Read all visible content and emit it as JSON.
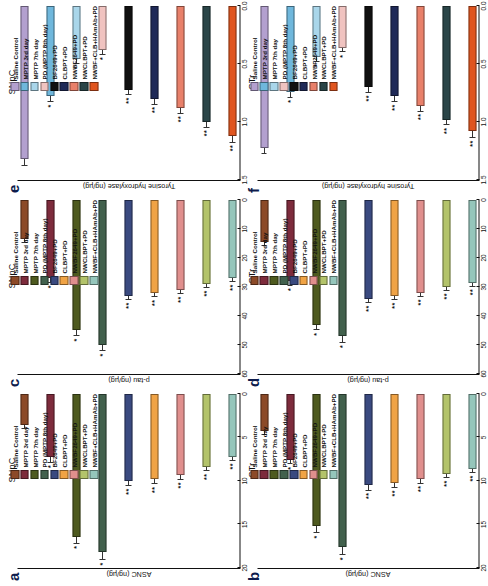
{
  "figure": {
    "groups": [
      {
        "label": "Saline Control",
        "color": "#8c4a28"
      },
      {
        "label": "MPTP 3rd day",
        "color": "#7d2b3c"
      },
      {
        "label": "MPTP 7th day",
        "color": "#4e5a1f"
      },
      {
        "label": "PD (MPTP 8th day)",
        "color": "#42614d"
      },
      {
        "label": "BF2649+PD",
        "color": "#3a4a80"
      },
      {
        "label": "CLBPT+PD",
        "color": "#f0a345"
      },
      {
        "label": "NWBF2649+PD",
        "color": "#e08f8d"
      },
      {
        "label": "NWCLBPT+PD",
        "color": "#b3c36a"
      },
      {
        "label": "NWBF+CLB+HAmAb+PD",
        "color": "#95c6bb"
      }
    ],
    "groups_ef": [
      {
        "label": "Saline Control",
        "color": "#b3a0cf"
      },
      {
        "label": "MPTP 3rd day",
        "color": "#6fb7dc"
      },
      {
        "label": "MPTP 7th day",
        "color": "#a9d6ea"
      },
      {
        "label": "PD (MPTP 8th day)",
        "color": "#f0c3c0"
      },
      {
        "label": "BF2649+PD",
        "color": "#111111"
      },
      {
        "label": "CLBPT+PD",
        "color": "#1f2a58"
      },
      {
        "label": "NWBF2649+PD",
        "color": "#e8806a"
      },
      {
        "label": "NWCLBPT+PD",
        "color": "#2a4548"
      },
      {
        "label": "NWBF+CLB+HAmAb+PD",
        "color": "#e0551f"
      }
    ]
  },
  "chart_data": [
    {
      "panel": "a",
      "type": "bar",
      "title": "SNpC",
      "xlabel": "",
      "ylabel": "ASNC (ng/µg)",
      "ylim": [
        0,
        20
      ],
      "ticks": [
        0,
        5,
        10,
        15,
        20
      ],
      "orientation": "horizontal",
      "categories": [
        "Saline Control",
        "MPTP 3rd day",
        "MPTP 7th day",
        "PD (MPTP 8th day)",
        "BF2649+PD",
        "CLBPT+PD",
        "NWBF2649+PD",
        "NWCLBPT+PD",
        "NWBF+CLB+HAmAb+PD"
      ],
      "values": [
        3.6,
        7.3,
        16.4,
        18.2,
        10.0,
        9.8,
        9.3,
        8.4,
        7.2
      ],
      "errors": [
        0.4,
        0.6,
        0.8,
        0.9,
        0.6,
        0.6,
        0.6,
        0.5,
        0.5
      ],
      "annotations": [
        "",
        "*",
        "*",
        "*",
        "**",
        "**",
        "**",
        "**",
        "**"
      ]
    },
    {
      "panel": "b",
      "type": "bar",
      "title": "STr",
      "xlabel": "",
      "ylabel": "ASNC (ng/µg)",
      "ylim": [
        0,
        20
      ],
      "ticks": [
        0,
        5,
        10,
        15,
        20
      ],
      "orientation": "horizontal",
      "categories": [
        "Saline Control",
        "MPTP 3rd day",
        "MPTP 7th day",
        "PD (MPTP 8th day)",
        "BF2649+PD",
        "CLBPT+PD",
        "NWBF2649+PD",
        "NWCLBPT+PD",
        "NWBF+CLB+HAmAb+PD"
      ],
      "values": [
        4.3,
        7.6,
        15.2,
        17.6,
        10.5,
        10.2,
        9.8,
        9.2,
        8.6
      ],
      "errors": [
        0.4,
        0.5,
        0.8,
        0.9,
        0.6,
        0.6,
        0.5,
        0.5,
        0.5
      ],
      "annotations": [
        "",
        "*",
        "*",
        "*",
        "**",
        "**",
        "**",
        "**",
        "**"
      ]
    },
    {
      "panel": "c",
      "type": "bar",
      "title": "SNpC",
      "xlabel": "",
      "ylabel": "p-tau (ng/µg)",
      "ylim": [
        0,
        60
      ],
      "ticks": [
        0,
        10,
        20,
        30,
        40,
        50,
        60
      ],
      "orientation": "horizontal",
      "categories": [
        "Saline Control",
        "MPTP 3rd day",
        "MPTP 7th day",
        "PD (MPTP 8th day)",
        "BF2649+PD",
        "CLBPT+PD",
        "NWBF2649+PD",
        "NWCLBPT+PD",
        "NWBF+CLB+HAmAb+PD"
      ],
      "values": [
        13.5,
        27.0,
        45.0,
        50.0,
        33.0,
        32.0,
        31.0,
        29.0,
        27.0
      ],
      "errors": [
        1.2,
        1.6,
        2.0,
        2.2,
        1.6,
        1.6,
        1.5,
        1.4,
        1.4
      ],
      "annotations": [
        "",
        "*",
        "*",
        "*",
        "**",
        "**",
        "**",
        "**",
        "**"
      ]
    },
    {
      "panel": "d",
      "type": "bar",
      "title": "STr",
      "xlabel": "",
      "ylabel": "p-tau (ng/µg)",
      "ylim": [
        0,
        60
      ],
      "ticks": [
        0,
        10,
        20,
        30,
        40,
        50,
        60
      ],
      "orientation": "horizontal",
      "categories": [
        "Saline Control",
        "MPTP 3rd day",
        "MPTP 7th day",
        "PD (MPTP 8th day)",
        "BF2649+PD",
        "CLBPT+PD",
        "NWBF2649+PD",
        "NWCLBPT+PD",
        "NWBF+CLB+HAmAb+PD"
      ],
      "values": [
        14.5,
        28.0,
        43.0,
        47.0,
        34.0,
        33.0,
        32.0,
        30.0,
        28.5
      ],
      "errors": [
        1.2,
        1.6,
        2.0,
        2.2,
        1.6,
        1.6,
        1.5,
        1.4,
        1.4
      ],
      "annotations": [
        "",
        "*",
        "*",
        "*",
        "**",
        "**",
        "**",
        "**",
        "**"
      ]
    },
    {
      "panel": "e",
      "type": "bar",
      "title": "SNpC",
      "xlabel": "",
      "ylabel": "Tyrosine hydroxylase (ng/µg)",
      "ylim": [
        0.0,
        1.5
      ],
      "ticks": [
        0.0,
        0.5,
        1.0,
        1.5
      ],
      "orientation": "horizontal",
      "categories": [
        "Saline Control",
        "MPTP 3rd day",
        "MPTP 7th day",
        "PD (MPTP 8th day)",
        "BF2649+PD",
        "CLBPT+PD",
        "NWBF2649+PD",
        "NWCLBPT+PD",
        "NWBF+CLB+HAmAb+PD"
      ],
      "values": [
        1.32,
        0.78,
        0.46,
        0.38,
        0.72,
        0.8,
        0.88,
        1.0,
        1.12
      ],
      "errors": [
        0.06,
        0.05,
        0.04,
        0.04,
        0.05,
        0.05,
        0.05,
        0.05,
        0.06
      ],
      "annotations": [
        "",
        "*",
        "*",
        "*",
        "**",
        "**",
        "**",
        "**",
        "**"
      ]
    },
    {
      "panel": "f",
      "type": "bar",
      "title": "STr",
      "xlabel": "",
      "ylabel": "Tyrosine hydroxylase (ng/µg)",
      "ylim": [
        0.0,
        1.5
      ],
      "ticks": [
        0.0,
        0.5,
        1.0,
        1.5
      ],
      "orientation": "horizontal",
      "categories": [
        "Saline Control",
        "MPTP 3rd day",
        "MPTP 7th day",
        "PD (MPTP 8th day)",
        "BF2649+PD",
        "CLBPT+PD",
        "NWBF2649+PD",
        "NWCLBPT+PD",
        "NWBF+CLB+HAmAb+PD"
      ],
      "values": [
        1.22,
        0.74,
        0.44,
        0.36,
        0.7,
        0.78,
        0.86,
        0.98,
        1.08
      ],
      "errors": [
        0.06,
        0.05,
        0.04,
        0.04,
        0.05,
        0.05,
        0.05,
        0.05,
        0.06
      ],
      "annotations": [
        "",
        "*",
        "*",
        "*",
        "**",
        "**",
        "**",
        "**",
        "**"
      ]
    }
  ],
  "panel_letters": {
    "a": "a",
    "b": "b",
    "c": "c",
    "d": "d",
    "e": "e",
    "f": "f"
  }
}
